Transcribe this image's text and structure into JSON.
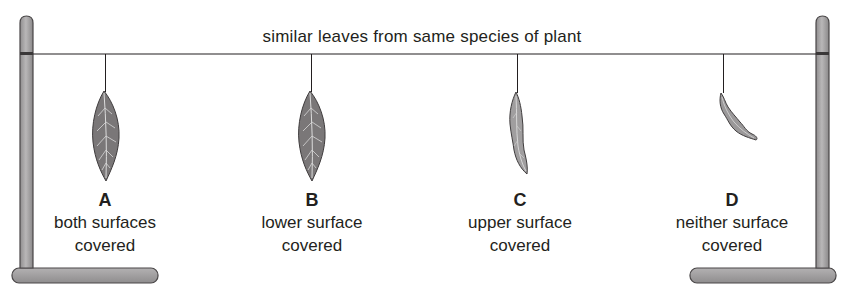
{
  "diagram": {
    "title": "similar leaves from same species of plant",
    "colors": {
      "pole_fill": "#a7a5a6",
      "pole_stroke": "#4a4748",
      "wire": "#231f20",
      "leaf_fill": "#7a7778",
      "leaf_light": "#b3b1b2",
      "vein": "#e6e6e6"
    },
    "leaves": [
      {
        "letter": "A",
        "line1": "both surfaces",
        "line2": "covered",
        "state": "healthy"
      },
      {
        "letter": "B",
        "line1": "lower surface",
        "line2": "covered",
        "state": "healthy"
      },
      {
        "letter": "C",
        "line1": "upper surface",
        "line2": "covered",
        "state": "wilted"
      },
      {
        "letter": "D",
        "line1": "neither surface",
        "line2": "covered",
        "state": "shrivelled"
      }
    ]
  }
}
